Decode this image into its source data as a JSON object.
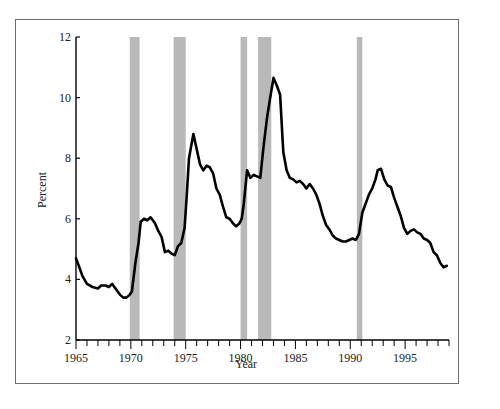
{
  "chart_data": {
    "type": "line",
    "title": "",
    "xlabel": "Year",
    "ylabel": "Percent",
    "xlim": [
      1965,
      1999
    ],
    "ylim": [
      2,
      12
    ],
    "x_ticks_major": [
      1965,
      1970,
      1975,
      1980,
      1985,
      1990,
      1995
    ],
    "x_ticks_minor_step": 1,
    "y_ticks": [
      2,
      4,
      6,
      8,
      10,
      12
    ],
    "grid": false,
    "legend": null,
    "colors": {
      "line": "#000000",
      "recession_band": "#b9b9b9",
      "axis": "#000000",
      "frame": "#6f6f6f"
    },
    "recession_bands": [
      {
        "start": 1969.9,
        "end": 1970.8
      },
      {
        "start": 1973.9,
        "end": 1975.0
      },
      {
        "start": 1980.0,
        "end": 1980.6
      },
      {
        "start": 1981.6,
        "end": 1982.8
      },
      {
        "start": 1990.6,
        "end": 1991.1
      }
    ],
    "series": [
      {
        "name": "Percent",
        "x": [
          1965.0,
          1965.3,
          1965.6,
          1966.0,
          1966.5,
          1967.0,
          1967.3,
          1967.7,
          1968.0,
          1968.3,
          1968.6,
          1969.0,
          1969.3,
          1969.6,
          1969.9,
          1970.1,
          1970.4,
          1970.7,
          1970.9,
          1971.2,
          1971.5,
          1971.8,
          1972.2,
          1972.5,
          1972.8,
          1973.1,
          1973.4,
          1973.7,
          1974.0,
          1974.3,
          1974.6,
          1974.9,
          1975.1,
          1975.3,
          1975.5,
          1975.7,
          1976.0,
          1976.3,
          1976.6,
          1976.9,
          1977.2,
          1977.5,
          1977.8,
          1978.1,
          1978.4,
          1978.7,
          1979.0,
          1979.3,
          1979.6,
          1979.9,
          1980.1,
          1980.3,
          1980.6,
          1980.9,
          1981.2,
          1981.5,
          1981.8,
          1982.1,
          1982.4,
          1982.7,
          1983.0,
          1983.3,
          1983.6,
          1983.9,
          1984.2,
          1984.5,
          1984.8,
          1985.1,
          1985.4,
          1985.7,
          1986.0,
          1986.3,
          1986.6,
          1986.9,
          1987.2,
          1987.5,
          1987.8,
          1988.1,
          1988.4,
          1988.7,
          1989.0,
          1989.3,
          1989.6,
          1989.9,
          1990.2,
          1990.5,
          1990.8,
          1991.1,
          1991.4,
          1991.7,
          1992.0,
          1992.3,
          1992.5,
          1992.8,
          1993.1,
          1993.4,
          1993.7,
          1994.0,
          1994.3,
          1994.6,
          1994.9,
          1995.2,
          1995.5,
          1995.8,
          1996.1,
          1996.4,
          1996.7,
          1997.0,
          1997.3,
          1997.6,
          1997.9,
          1998.2,
          1998.5,
          1998.8
        ],
        "values": [
          4.7,
          4.4,
          4.1,
          3.85,
          3.75,
          3.7,
          3.8,
          3.8,
          3.75,
          3.85,
          3.7,
          3.5,
          3.4,
          3.4,
          3.5,
          3.6,
          4.5,
          5.2,
          5.9,
          6.0,
          5.95,
          6.05,
          5.85,
          5.6,
          5.4,
          4.9,
          4.95,
          4.85,
          4.8,
          5.1,
          5.2,
          5.7,
          6.8,
          8.0,
          8.4,
          8.8,
          8.3,
          7.8,
          7.6,
          7.75,
          7.7,
          7.5,
          7.0,
          6.8,
          6.4,
          6.05,
          6.0,
          5.85,
          5.75,
          5.85,
          6.0,
          6.5,
          7.6,
          7.35,
          7.45,
          7.4,
          7.35,
          8.4,
          9.3,
          10.0,
          10.65,
          10.4,
          10.1,
          8.2,
          7.6,
          7.35,
          7.3,
          7.2,
          7.25,
          7.15,
          7.0,
          7.15,
          7.0,
          6.8,
          6.5,
          6.1,
          5.8,
          5.65,
          5.45,
          5.35,
          5.3,
          5.25,
          5.25,
          5.3,
          5.35,
          5.3,
          5.5,
          6.2,
          6.5,
          6.8,
          7.0,
          7.3,
          7.6,
          7.65,
          7.3,
          7.1,
          7.05,
          6.7,
          6.4,
          6.1,
          5.7,
          5.5,
          5.6,
          5.65,
          5.55,
          5.5,
          5.35,
          5.3,
          5.2,
          4.9,
          4.8,
          4.55,
          4.4,
          4.45
        ]
      }
    ]
  }
}
